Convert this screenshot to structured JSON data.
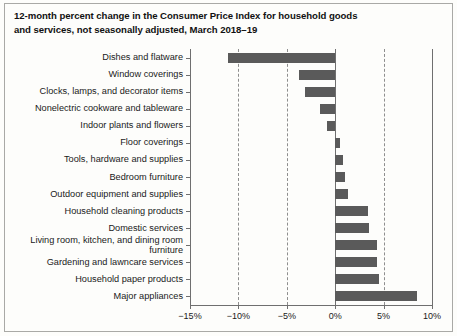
{
  "title": {
    "line1": "12-month percent change in the Consumer Price Index for household goods",
    "line2": "and services, not seasonally adjusted, March 2018–19"
  },
  "colors": {
    "bar": "#5a5a5a",
    "axis": "#6f6f6f",
    "grid": "#8e8e8e",
    "text": "#1a1a1a",
    "background": "#fdfdfb",
    "frame": "#a9a9a6"
  },
  "axis": {
    "ticks": [
      "−15%",
      "−10%",
      "−5%",
      "0%",
      "5%",
      "10%"
    ],
    "tick_values": [
      -15,
      -10,
      -5,
      0,
      5,
      10
    ]
  },
  "chart_data": {
    "type": "bar",
    "orientation": "horizontal",
    "title": "12-month percent change in the Consumer Price Index for household goods and services, not seasonally adjusted, March 2018–19",
    "xlabel": "",
    "ylabel": "",
    "xlim": [
      -15,
      10
    ],
    "grid": true,
    "legend": false,
    "categories": [
      "Dishes and flatware",
      "Window coverings",
      "Clocks, lamps, and decorator items",
      "Nonelectric cookware and tableware",
      "Indoor plants and flowers",
      "Floor coverings",
      "Tools, hardware and supplies",
      "Bedroom furniture",
      "Outdoor equipment and supplies",
      "Household cleaning products",
      "Domestic services",
      "Living room, kitchen, and dining room furniture",
      "Gardening and lawncare services",
      "Household paper products",
      "Major appliances"
    ],
    "values": [
      -11.1,
      -3.7,
      -3.1,
      -1.6,
      -0.8,
      0.5,
      0.8,
      1.0,
      1.3,
      3.4,
      3.5,
      4.3,
      4.3,
      4.5,
      8.5
    ]
  }
}
